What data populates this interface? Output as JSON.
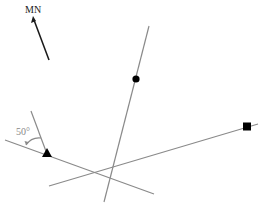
{
  "diagram": {
    "north_label": "MN",
    "angle_label": "50°",
    "colors": {
      "line": "#8a8a8a",
      "arrow": "#1a1a1a",
      "marker": "#000000",
      "angle_text": "#888888",
      "north_text": "#222222"
    },
    "markers": [
      {
        "shape": "circle",
        "name": "circle-marker"
      },
      {
        "shape": "square",
        "name": "square-marker"
      },
      {
        "shape": "triangle",
        "name": "triangle-marker"
      }
    ]
  }
}
